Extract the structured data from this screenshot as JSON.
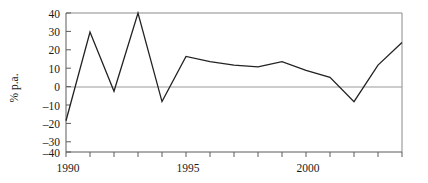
{
  "chart_data": {
    "type": "line",
    "title": "",
    "subtitle": "",
    "xlabel": "",
    "ylabel": "% p.a.",
    "xlim": [
      1990,
      2004
    ],
    "ylim": [
      -40,
      40
    ],
    "grid": false,
    "legend": null,
    "zero_line": 0,
    "x": [
      1990,
      1991,
      1992,
      1993,
      1994,
      1995,
      1996,
      1997,
      1998,
      1999,
      2000,
      2001,
      2002,
      2003,
      2004
    ],
    "values": [
      -22,
      29,
      -5,
      40,
      -11,
      15,
      12,
      10,
      9,
      12,
      7,
      3,
      -11,
      10,
      23
    ],
    "series": [
      {
        "name": "% p.a.",
        "values": [
          -22,
          29,
          -5,
          40,
          -11,
          15,
          12,
          10,
          9,
          12,
          7,
          3,
          -11,
          10,
          23
        ]
      }
    ],
    "ytick_values": [
      40,
      30,
      20,
      10,
      0,
      -10,
      -20,
      -30,
      -40
    ],
    "ytick_labels": [
      "40",
      "30",
      "20",
      "10",
      "0",
      "–10",
      "–20",
      "–30",
      "–40"
    ],
    "xtick_values": [
      1990,
      1991,
      1992,
      1993,
      1994,
      1995,
      1996,
      1997,
      1998,
      1999,
      2000,
      2001,
      2002,
      2003,
      2004
    ],
    "xtick_labels_shown": [
      "1990",
      "1995",
      "2000"
    ],
    "xtick_labeled_values": [
      1990,
      1995,
      2000
    ],
    "line_color": "#222222",
    "axis_color": "#5a5a5a",
    "frame_color": "#8a8a8a"
  },
  "axis": {
    "y_title": "% p.a.",
    "y_labels": {
      "t40": "40",
      "t30": "30",
      "t20": "20",
      "t10": "10",
      "t0": "0",
      "tm10": "–10",
      "tm20": "–20",
      "tm30": "–30",
      "tm40": "–40"
    },
    "x_labels": {
      "x1990": "1990",
      "x1995": "1995",
      "x2000": "2000"
    }
  }
}
